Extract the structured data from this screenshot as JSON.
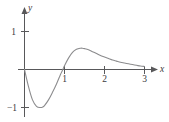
{
  "figure": {
    "background_color": "#ffffff",
    "curve_color": "#8c8c8e",
    "axis_color": "#58585a",
    "text_color": "#3a3a3c",
    "width": 169,
    "height": 122
  },
  "axes": {
    "x_label": "x",
    "y_label": "y",
    "x_ticks": [
      {
        "value": "1",
        "label": "1"
      },
      {
        "value": "2",
        "label": "2"
      },
      {
        "value": "3",
        "label": "3"
      }
    ],
    "y_ticks": [
      {
        "value": "1",
        "label": "1"
      },
      {
        "value": "-1",
        "label": "−1"
      }
    ]
  },
  "chart_data": {
    "type": "line",
    "title": "",
    "xlabel": "x",
    "ylabel": "y",
    "xlim": [
      -0.15,
      3.35
    ],
    "ylim": [
      -1.25,
      1.25
    ],
    "grid": false,
    "legend": "none",
    "x_ticks": [
      1,
      2,
      3
    ],
    "y_ticks": [
      -1,
      1
    ],
    "annotations": [],
    "series": [
      {
        "name": "curve",
        "x": [
          0.0,
          0.1,
          0.2,
          0.3,
          0.4,
          0.45,
          0.5,
          0.6,
          0.7,
          0.8,
          0.9,
          0.95,
          1.0,
          1.1,
          1.2,
          1.3,
          1.4,
          1.45,
          1.5,
          1.6,
          1.7,
          1.8,
          1.9,
          2.0,
          2.1,
          2.2,
          2.3,
          2.4,
          2.5,
          2.6,
          2.7,
          2.8,
          2.9,
          3.0
        ],
        "y": [
          0.0,
          -0.45,
          -0.8,
          -0.97,
          -1.0,
          -0.99,
          -0.95,
          -0.8,
          -0.6,
          -0.38,
          -0.13,
          -0.02,
          0.1,
          0.3,
          0.45,
          0.53,
          0.56,
          0.56,
          0.55,
          0.52,
          0.47,
          0.42,
          0.37,
          0.33,
          0.29,
          0.25,
          0.22,
          0.19,
          0.17,
          0.15,
          0.13,
          0.11,
          0.09,
          0.08
        ]
      }
    ]
  }
}
